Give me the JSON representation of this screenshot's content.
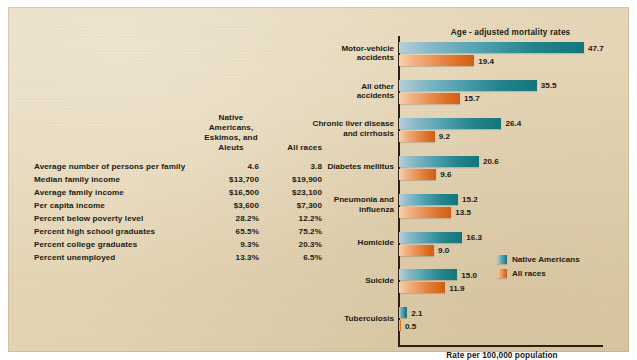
{
  "panel": {
    "background_color": "#e6d8ba",
    "text_color": "#201a12"
  },
  "stats_table": {
    "name": "socioeconomic-comparison-table",
    "headers": {
      "row_label": "",
      "native_americans_line1": "Native Americans,",
      "native_americans_line2": "Eskimos, and Aleuts",
      "all_races": "All races"
    },
    "rows": [
      {
        "label": "Average number of persons per family",
        "native": "4.6",
        "all": "3.8"
      },
      {
        "label": "Median family income",
        "native": "$13,700",
        "all": "$19,900"
      },
      {
        "label": "Average family income",
        "native": "$16,500",
        "all": "$23,100"
      },
      {
        "label": "Per capita income",
        "native": "$3,600",
        "all": "$7,300"
      },
      {
        "label": "Percent below poverty level",
        "native": "28.2%",
        "all": "12.2%"
      },
      {
        "label": "Percent high school graduates",
        "native": "65.5%",
        "all": "75.2%"
      },
      {
        "label": "Percent college graduates",
        "native": "9.3%",
        "all": "20.3%"
      },
      {
        "label": "Percent unemployed",
        "native": "13.3%",
        "all": "6.5%"
      }
    ]
  },
  "chart_data": {
    "type": "bar",
    "orientation": "horizontal",
    "title": "Age - adjusted mortality rates",
    "xlabel": "Rate per 100,000 population",
    "ylabel": "",
    "xlim": [
      0,
      52.8
    ],
    "grid": false,
    "legend_position": "inside-right",
    "categories": [
      "Motor-vehicle\naccidents",
      "All other\naccidents",
      "Chronic liver disease\nand cirrhosis",
      "Diabetes mellitus",
      "Pneumonia and\ninfluenza",
      "Homicide",
      "Suicide",
      "Tuberculosis"
    ],
    "category_lines": [
      [
        "Motor-vehicle",
        "accidents"
      ],
      [
        "All other",
        "accidents"
      ],
      [
        "Chronic liver disease",
        "and cirrhosis"
      ],
      [
        "Diabetes mellitus"
      ],
      [
        "Pneumonia and",
        "influenza"
      ],
      [
        "Homicide"
      ],
      [
        "Suicide"
      ],
      [
        "Tuberculosis"
      ]
    ],
    "series": [
      {
        "name": "Native Americans",
        "color": "#14757a",
        "values": [
          47.7,
          35.5,
          26.4,
          20.6,
          15.2,
          16.3,
          15.0,
          2.1
        ],
        "labels": [
          "47.7",
          "35.5",
          "26.4",
          "20.6",
          "15.2",
          "16.3",
          "15.0",
          "2.1"
        ]
      },
      {
        "name": "All races",
        "color": "#cf5f16",
        "values": [
          19.4,
          15.7,
          9.2,
          9.6,
          13.5,
          9.0,
          11.9,
          0.5
        ],
        "labels": [
          "19.4",
          "15.7",
          "9.2",
          "9.6",
          "13.5",
          "9.0",
          "11.9",
          "0.5"
        ]
      }
    ]
  }
}
